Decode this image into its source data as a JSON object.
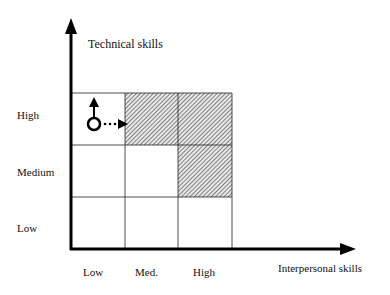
{
  "diagram": {
    "y_axis_label": "Technical skills",
    "x_axis_label": "Interpersonal skills",
    "y_levels": [
      "High",
      "Medium",
      "Low"
    ],
    "x_levels": [
      "Low",
      "Med.",
      "High"
    ],
    "shaded_cells": [
      {
        "x": "Med.",
        "y": "High"
      },
      {
        "x": "High",
        "y": "High"
      },
      {
        "x": "High",
        "y": "Medium"
      }
    ],
    "position_marker": {
      "x": "Low",
      "y": "High",
      "shape": "circle"
    },
    "arrows": [
      {
        "direction": "up",
        "style": "solid"
      },
      {
        "direction": "right",
        "style": "dotted"
      }
    ],
    "colors": {
      "line": "#111111",
      "hatch": "#555555",
      "background": "#ffffff"
    }
  }
}
